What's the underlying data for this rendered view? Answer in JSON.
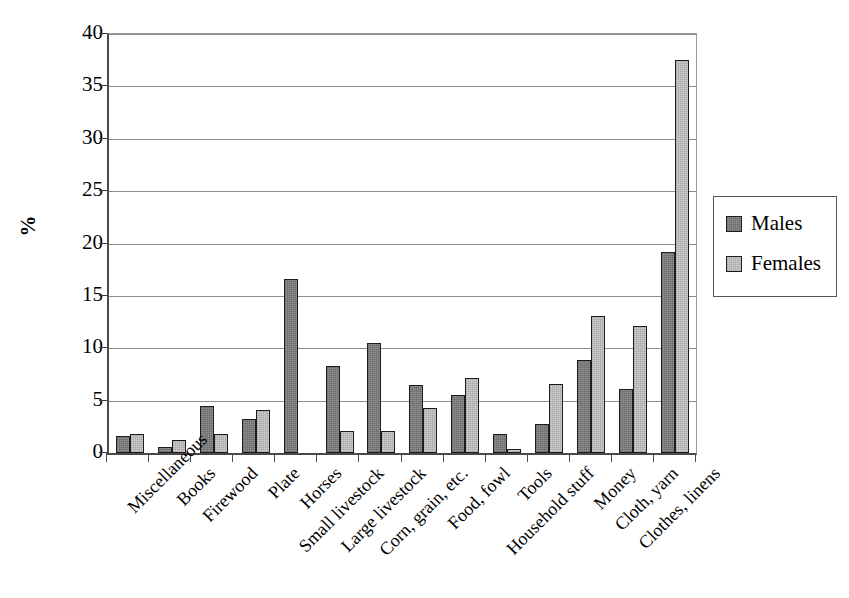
{
  "chart_data": {
    "type": "bar",
    "title": "",
    "xlabel": "",
    "ylabel": "%",
    "ylim": [
      0,
      40
    ],
    "yticks": [
      0,
      5,
      10,
      15,
      20,
      25,
      30,
      35,
      40
    ],
    "grid": true,
    "legend_position": "right",
    "categories": [
      "Miscellaneous",
      "Books",
      "Firewood",
      "Plate",
      "Horses",
      "Small livestock",
      "Large livestock",
      "Corn, grain, etc.",
      "Food, fowl",
      "Tools",
      "Household stuff",
      "Money",
      "Cloth, yarn",
      "Clothes, linens"
    ],
    "series": [
      {
        "name": "Males",
        "color": "#8f8f8f",
        "values": [
          1.6,
          0.6,
          4.5,
          3.2,
          16.6,
          8.3,
          10.5,
          6.5,
          5.5,
          1.8,
          2.8,
          8.9,
          6.1,
          19.2
        ]
      },
      {
        "name": "Females",
        "color": "#cdcdcd",
        "values": [
          1.8,
          1.2,
          1.8,
          4.1,
          0,
          2.1,
          2.1,
          4.3,
          7.2,
          0.4,
          6.6,
          13.1,
          12.1,
          37.5
        ]
      }
    ]
  },
  "legend": {
    "entries": [
      {
        "label": "Males"
      },
      {
        "label": "Females"
      }
    ]
  }
}
